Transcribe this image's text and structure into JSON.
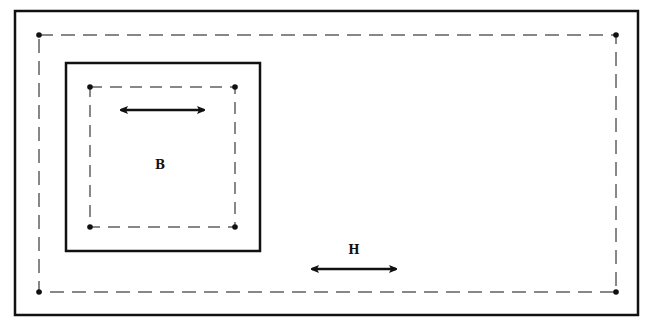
{
  "diagram": {
    "colors": {
      "stroke": "#111111",
      "background": "#ffffff"
    },
    "outer_box": {
      "label": "H"
    },
    "inner_box": {
      "label": "B"
    }
  }
}
